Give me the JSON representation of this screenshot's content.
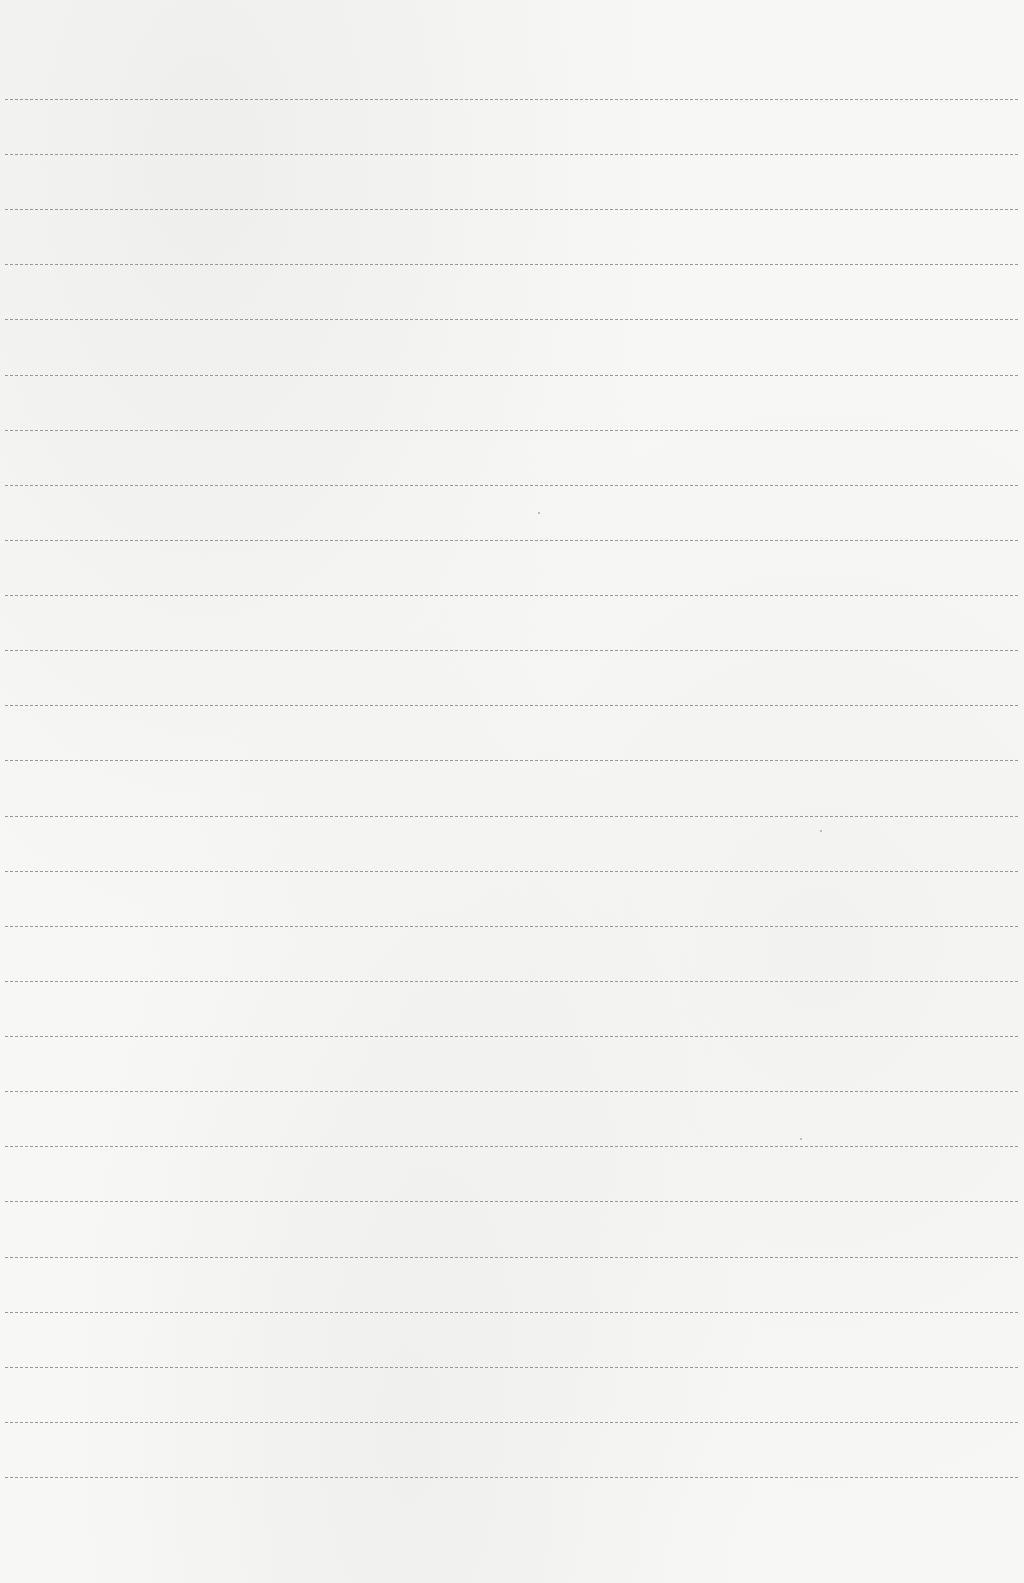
{
  "page": {
    "type": "lined-paper",
    "background_color": "#f7f7f6",
    "rule_color": "#8a8a8a",
    "rule_style": "dashed",
    "rule_count": 26,
    "first_rule_y": 99,
    "rule_spacing": 55.12,
    "rule_left": 5,
    "rule_right": 1018
  }
}
